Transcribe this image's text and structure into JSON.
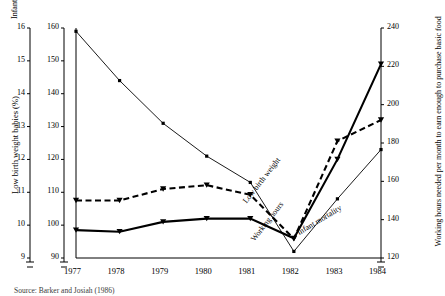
{
  "figure": {
    "source_note": "Source:  Barker and Josiah (1986)"
  },
  "chart_data": {
    "type": "line",
    "title": "",
    "xlabel": "",
    "x": [
      1977,
      1978,
      1979,
      1980,
      1981,
      1982,
      1983,
      1984
    ],
    "xticklabels": [
      "1977",
      "1978",
      "1979",
      "1980",
      "1981",
      "1982",
      "1983",
      "1984"
    ],
    "grid": false,
    "legend": "inline-annotations",
    "axes": [
      {
        "id": "left-outer",
        "label": "Low birth weight babies (%)",
        "ticks": [
          9,
          10,
          11,
          12,
          13,
          14,
          15,
          16
        ],
        "lim": [
          9,
          16
        ],
        "position": "left-outer"
      },
      {
        "id": "left-inner",
        "label": "Infant mortality",
        "ticks": [
          90,
          100,
          110,
          120,
          130,
          140,
          150,
          160
        ],
        "lim": [
          90,
          160
        ],
        "position": "left-inner"
      },
      {
        "id": "right",
        "label": "Working hours needed per month to earn enough to purchase basic food",
        "ticks": [
          120,
          140,
          160,
          180,
          200,
          220,
          240
        ],
        "lim": [
          120,
          240
        ],
        "position": "right"
      }
    ],
    "series": [
      {
        "name": "Infant mortality",
        "axis": "left-inner",
        "style": "thin-solid-square-markers",
        "values": [
          159,
          144,
          131,
          121,
          113,
          92,
          108,
          123
        ]
      },
      {
        "name": "Low birth weight",
        "axis": "left-outer",
        "style": "thick-solid-triangle-markers",
        "values": [
          9.85,
          9.8,
          10.1,
          10.2,
          10.2,
          9.6,
          12.0,
          14.9
        ]
      },
      {
        "name": "Working hours",
        "axis": "right",
        "style": "thick-dashed-triangle-markers",
        "values": [
          150,
          150,
          156,
          158,
          153,
          130,
          181,
          192
        ]
      }
    ],
    "annotations": [
      {
        "text": "Low birth weight",
        "rotation": -52
      },
      {
        "text": "Working hours",
        "rotation": -52
      },
      {
        "text": "Infant mortality",
        "rotation": -31
      }
    ]
  }
}
